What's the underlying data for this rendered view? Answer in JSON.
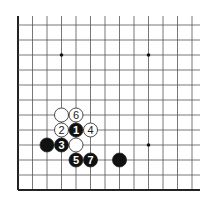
{
  "diagram": {
    "type": "go-board-fragment",
    "grid": {
      "origin_x": 18,
      "origin_y": 25,
      "spacing_x": 14.5,
      "spacing_y": 15,
      "columns": 13,
      "rows": 12,
      "top_extend": 16,
      "right_extend": 200,
      "edges": [
        "left",
        "bottom"
      ],
      "line_color": "#555555",
      "edge_color": "#222222"
    },
    "star_points": [
      {
        "col": 3,
        "row": 2
      },
      {
        "col": 9,
        "row": 2
      },
      {
        "col": 9,
        "row": 8
      }
    ],
    "stones": [
      {
        "color": "white",
        "col": 3,
        "row": 6,
        "label": ""
      },
      {
        "color": "white",
        "col": 4,
        "row": 6,
        "label": "6"
      },
      {
        "color": "white",
        "col": 3,
        "row": 7,
        "label": "2"
      },
      {
        "color": "black",
        "col": 4,
        "row": 7,
        "label": "1"
      },
      {
        "color": "white",
        "col": 5,
        "row": 7,
        "label": "4"
      },
      {
        "color": "black",
        "col": 2,
        "row": 8,
        "label": ""
      },
      {
        "color": "black",
        "col": 3,
        "row": 8,
        "label": "3"
      },
      {
        "color": "white",
        "col": 4,
        "row": 8,
        "label": ""
      },
      {
        "color": "black",
        "col": 4,
        "row": 9,
        "label": "5"
      },
      {
        "color": "black",
        "col": 5,
        "row": 9,
        "label": "7"
      },
      {
        "color": "black",
        "col": 7,
        "row": 9,
        "label": ""
      }
    ],
    "colors": {
      "black_stone": "#111111",
      "white_stone": "#ffffff",
      "stone_outline": "#222222",
      "label_on_black": "#ffffff",
      "label_on_white": "#222222"
    }
  }
}
